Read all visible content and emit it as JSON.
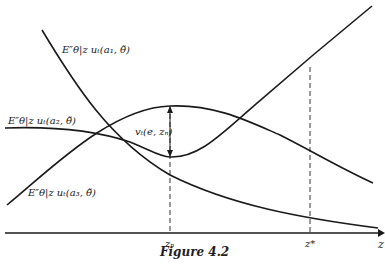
{
  "figure": {
    "caption": "Figure 4.2",
    "axis_label": "z",
    "ticks": [
      {
        "label": "zₙ",
        "x": 170
      },
      {
        "label": "z*",
        "x": 310
      }
    ],
    "curves": [
      {
        "id": "a1",
        "label": "E″θ|z uₜ(a₁, θ̃)"
      },
      {
        "id": "a2",
        "label": "E″θ|z uₜ(a₂, θ̃)"
      },
      {
        "id": "a3",
        "label": "E″θ|z uₜ(a₃, θ̃)"
      }
    ],
    "annotation": "vₜ(e, zₙ)"
  }
}
